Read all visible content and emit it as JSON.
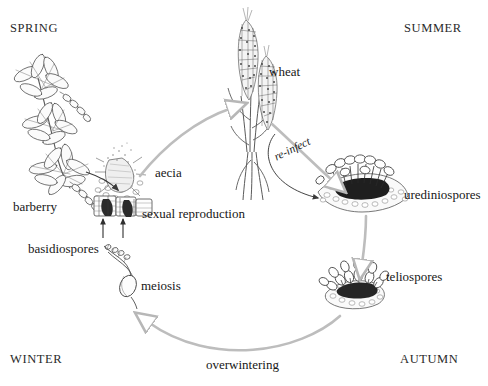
{
  "figure": {
    "background_color": "#ffffff",
    "ink_color": "#1d1d1d",
    "arrow_color": "#b9b9b9"
  },
  "seasons": {
    "spring": "SPRING",
    "summer": "SUMMER",
    "autumn": "AUTUMN",
    "winter": "WINTER"
  },
  "labels": {
    "barberry": "barberry",
    "aecia": "aecia",
    "sexual_reproduction": "sexual reproduction",
    "wheat": "wheat",
    "re_infect": "re-infect",
    "urediniospores": "urediniospores",
    "teliospores": "teliospores",
    "overwintering": "overwintering",
    "meiosis": "meiosis",
    "basidiospores": "basidiospores"
  },
  "stages": [
    {
      "name": "barberry",
      "label": "barberry",
      "season": "SPRING"
    },
    {
      "name": "aecia",
      "label": "aecia",
      "season": "SPRING"
    },
    {
      "name": "wheat",
      "label": "wheat",
      "season": "SUMMER"
    },
    {
      "name": "urediniospores",
      "label": "urediniospores",
      "season": "SUMMER"
    },
    {
      "name": "teliospores",
      "label": "teliospores",
      "season": "AUTUMN"
    },
    {
      "name": "basidiospores",
      "label": "basidiospores",
      "season": "WINTER"
    }
  ],
  "processes": [
    {
      "name": "sexual-reproduction",
      "label": "sexual reproduction"
    },
    {
      "name": "re-infect",
      "label": "re-infect"
    },
    {
      "name": "overwintering",
      "label": "overwintering"
    },
    {
      "name": "meiosis",
      "label": "meiosis"
    }
  ]
}
